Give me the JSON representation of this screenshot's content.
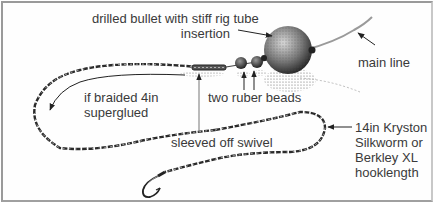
{
  "diagram": {
    "labels": {
      "bullet": {
        "line1": "drilled bullet with stiff rig tube",
        "line2": "insertion"
      },
      "main_line": {
        "text": "main line"
      },
      "beads": {
        "text": "two ruber beads"
      },
      "braided": {
        "line1": "if braided 4in",
        "line2": "superglued"
      },
      "swivel": {
        "text": "sleeved off swivel"
      },
      "hooklength": {
        "line1": "14in Kryston",
        "line2": "Silkworm or",
        "line3": "Berkley XL",
        "line4": "hooklength"
      }
    },
    "components": [
      "main-line",
      "drilled-bullet-lead",
      "rubber-bead-1",
      "rubber-bead-2",
      "swivel",
      "braided-hooklength",
      "hook"
    ],
    "colors": {
      "ink": "#2a2a2a",
      "text": "#3a3a3a",
      "border": "#9a9a9a",
      "background": "#ffffff"
    }
  }
}
